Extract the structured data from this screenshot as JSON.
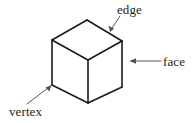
{
  "figure": {
    "width": 195,
    "height": 123,
    "background_color": "#ffffff",
    "line_color": "#1a1a1a",
    "leader_color": "#555555",
    "text_color": "#262626"
  },
  "labels": {
    "edge": "edge",
    "face": "face",
    "vertex": "vertex"
  },
  "shape": {
    "name": "cube",
    "projection": "isometric",
    "vertices": {
      "top_back": [
        87,
        20
      ],
      "top_left": [
        52,
        40
      ],
      "top_right": [
        122,
        41
      ],
      "top_front": [
        88,
        60
      ],
      "bottom_left": [
        52,
        85
      ],
      "bottom_front": [
        88,
        103
      ],
      "bottom_right": [
        122,
        87
      ]
    },
    "faces": [
      {
        "name": "top-face",
        "points": "87,20 122,41 88,60 52,40"
      },
      {
        "name": "left-face",
        "points": "52,40 88,60 88,103 52,85"
      },
      {
        "name": "right-face",
        "points": "88,60 122,41 122,87 88,103"
      }
    ]
  },
  "annotations": [
    {
      "name": "edge",
      "label": "edge",
      "target": "top-right-edge",
      "arrow_from": [
        120,
        16
      ],
      "arrow_to": [
        110,
        31
      ]
    },
    {
      "name": "face",
      "label": "face",
      "target": "right-face",
      "arrow_from": [
        161,
        61
      ],
      "arrow_to": [
        131,
        61
      ]
    },
    {
      "name": "vertex",
      "label": "vertex",
      "target": "bottom-left-vertex",
      "arrow_from": [
        27,
        104
      ],
      "arrow_to": [
        50,
        86
      ]
    }
  ]
}
